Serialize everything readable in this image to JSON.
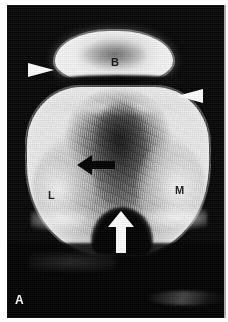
{
  "figure": {
    "panel_label": "A",
    "modality": "radiograph",
    "view": "axial / skyline knee view",
    "background_color": "#050505",
    "page_color": "#ffffff"
  },
  "labels": {
    "patella": "B",
    "lateral": "L",
    "medial": "M",
    "panel": "A"
  },
  "markers": {
    "arrowhead_left": {
      "name": "white-arrowhead-left",
      "color": "#ffffff",
      "direction": "right"
    },
    "arrowhead_right": {
      "name": "white-arrowhead-right",
      "color": "#ffffff",
      "direction": "left"
    },
    "arrow_black": {
      "name": "black-arrow",
      "color": "#000000",
      "direction": "left"
    },
    "arrow_white": {
      "name": "white-arrow",
      "color": "#ffffff",
      "direction": "up"
    }
  }
}
